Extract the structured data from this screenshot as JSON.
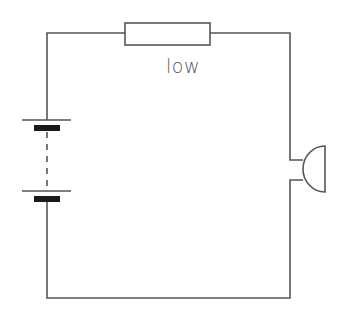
{
  "diagram": {
    "type": "circuit",
    "components": [
      {
        "kind": "cell-battery",
        "cells": 2,
        "connection": "dashed"
      },
      {
        "kind": "resistor",
        "label": "low"
      },
      {
        "kind": "buzzer"
      }
    ],
    "resistor_label": "low",
    "colors": {
      "wire": "#555555",
      "plate": "#1a1a1a",
      "background": "#ffffff"
    }
  }
}
